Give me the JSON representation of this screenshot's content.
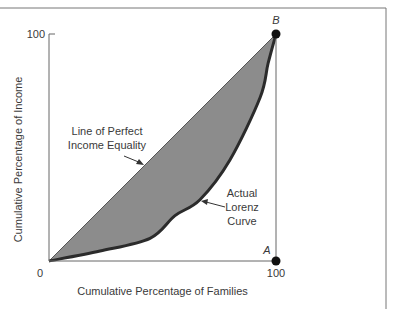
{
  "chart_data": {
    "type": "area",
    "title": "",
    "xlabel": "Cumulative Percentage of Families",
    "ylabel": "Cumulative Percentage of Income",
    "xlim": [
      0,
      100
    ],
    "ylim": [
      0,
      100
    ],
    "grid": false,
    "x_ticks": [
      {
        "value": 0,
        "label": "0"
      },
      {
        "value": 100,
        "label": "100"
      }
    ],
    "y_ticks": [
      {
        "value": 100,
        "label": "100"
      }
    ],
    "series": [
      {
        "name": "Line of Perfect Income Equality",
        "points": [
          [
            0,
            0
          ],
          [
            100,
            100
          ]
        ]
      },
      {
        "name": "Actual Lorenz Curve",
        "points": [
          [
            0,
            0
          ],
          [
            22.5,
            4.4
          ],
          [
            44.5,
            10
          ],
          [
            55.5,
            20
          ],
          [
            66.5,
            27
          ],
          [
            79.7,
            44.5
          ],
          [
            93,
            72
          ],
          [
            96.5,
            87
          ],
          [
            100,
            100
          ]
        ]
      }
    ],
    "shaded_region": "between equality line and Lorenz curve",
    "points": [
      {
        "name": "A",
        "x": 100,
        "y": 0
      },
      {
        "name": "B",
        "x": 100,
        "y": 100
      }
    ],
    "annotations": [
      {
        "id": "equality",
        "lines": [
          "Line of Perfect",
          "Income Equality"
        ],
        "target": [
          41,
          43
        ]
      },
      {
        "id": "lorenz",
        "lines": [
          "Actual",
          "Lorenz",
          "Curve"
        ],
        "target": [
          67,
          26
        ]
      }
    ],
    "colors": {
      "fill": "#8c8c8c",
      "curve": "#2b2b2b",
      "axis": "#555555",
      "point": "#111111"
    }
  }
}
